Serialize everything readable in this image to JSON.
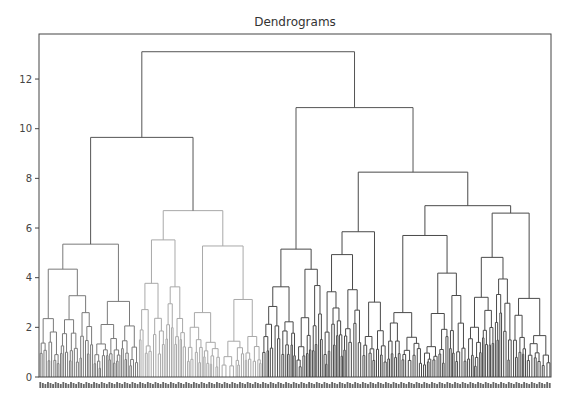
{
  "chart_data": {
    "type": "dendrogram",
    "title": "Dendrograms",
    "xlabel": "",
    "ylabel": "",
    "ylim": [
      0,
      13.8
    ],
    "yticks": [
      0,
      2,
      4,
      6,
      8,
      10,
      12
    ],
    "grid": false,
    "legend": null,
    "leaf_labels_visible": true,
    "leaf_labels_note": "Dense, illegible sample index labels along the x-axis (~200 leaves)",
    "clusters": [
      {
        "name": "cluster-1",
        "color": "#7a7a7a",
        "leaf_fraction": [
          0.0,
          0.195
        ]
      },
      {
        "name": "cluster-2",
        "color": "#a9a9a9",
        "leaf_fraction": [
          0.195,
          0.435
        ]
      },
      {
        "name": "cluster-3",
        "color": "#4a4a4a",
        "leaf_fraction": [
          0.435,
          1.0
        ]
      }
    ],
    "above_threshold_color": "#555555",
    "major_merges": [
      {
        "height": 13.1,
        "left_x": 0.175,
        "right_x": 0.615,
        "label": "root"
      },
      {
        "height": 9.65,
        "left_x": 0.06,
        "right_x": 0.29,
        "label": "left-branch"
      },
      {
        "height": 10.85,
        "left_x": 0.49,
        "right_x": 0.74,
        "label": "right-branch"
      },
      {
        "height": 5.35,
        "left_x": 0.02,
        "right_x": 0.1,
        "label": "cluster-1-top"
      },
      {
        "height": 6.7,
        "left_x": 0.24,
        "right_x": 0.34,
        "label": "cluster-2-top"
      },
      {
        "height": 5.15,
        "left_x": 0.455,
        "right_x": 0.535,
        "label": "cluster-3a-top"
      },
      {
        "height": 8.25,
        "left_x": 0.62,
        "right_x": 0.865,
        "label": "cluster-3b-top"
      },
      {
        "height": 5.85,
        "left_x": 0.575,
        "right_x": 0.66,
        "label": "sub-3b-left"
      },
      {
        "height": 6.9,
        "left_x": 0.755,
        "right_x": 0.955,
        "label": "sub-3b-right"
      },
      {
        "height": 5.7,
        "left_x": 0.71,
        "right_x": 0.79,
        "label": "sub-3b-r1"
      },
      {
        "height": 6.6,
        "left_x": 0.88,
        "right_x": 0.985,
        "label": "sub-3b-r2"
      }
    ]
  }
}
